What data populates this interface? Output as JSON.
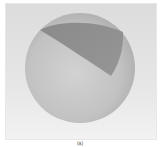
{
  "figure": {
    "colors": {
      "background_top": "#dcdcdc",
      "background_bottom": "#f2f2f2",
      "sphere_light": "#cfcfcf",
      "sphere_dark": "#a8a8a8",
      "cap": "#8e8e8e"
    },
    "caption": "(a)"
  }
}
